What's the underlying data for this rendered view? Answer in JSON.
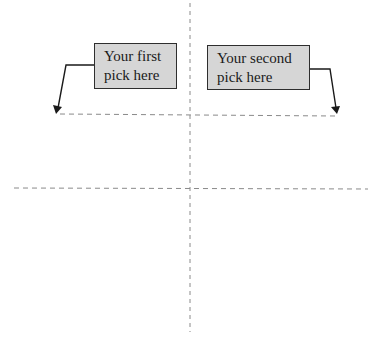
{
  "diagram": {
    "callouts": [
      {
        "line1": "Your first",
        "line2": "pick here",
        "arrow_direction": "down-left"
      },
      {
        "line1": "Your second",
        "line2": "pick here",
        "arrow_direction": "down-right"
      }
    ],
    "guides": {
      "vertical_axis": {
        "x": 190,
        "style": "dashed"
      },
      "upper_horizontal": {
        "y": 114,
        "style": "dashed"
      },
      "lower_horizontal": {
        "y": 188,
        "style": "dashed"
      }
    },
    "colors": {
      "box_fill": "#d6d6d6",
      "box_border": "#2e2e2e",
      "dashed_line": "#8a8a8a",
      "arrow": "#1a1a1a",
      "background": "#ffffff"
    }
  }
}
